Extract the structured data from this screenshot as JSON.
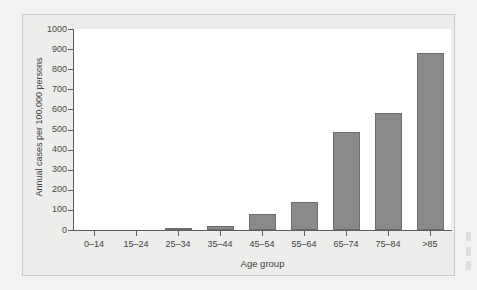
{
  "chart_data": {
    "type": "bar",
    "title": "",
    "xlabel": "Age group",
    "ylabel": "Annual cases per 100,000 persons",
    "categories": [
      "0–14",
      "15–24",
      "25–34",
      "35–44",
      "45–54",
      "55–64",
      "65–74",
      "75–84",
      ">85"
    ],
    "values": [
      0,
      0,
      5,
      20,
      80,
      140,
      490,
      580,
      880
    ],
    "ylim": [
      0,
      1000
    ],
    "yticks": [
      0,
      100,
      200,
      300,
      400,
      500,
      600,
      700,
      800,
      900,
      1000
    ],
    "ytick_labels": [
      "0",
      "100",
      "200",
      "300",
      "400",
      "500",
      "600",
      "700",
      "800",
      "900",
      "1000"
    ],
    "grid": false,
    "legend": null,
    "bar_color": "#8a8a8a",
    "bar_edge_color": "#6d6d6d",
    "plot_background": "#ffffff",
    "panel_background": "#ededeb",
    "axis_color": "#5e5e5e"
  }
}
